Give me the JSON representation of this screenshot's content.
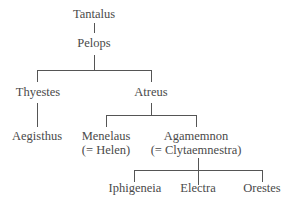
{
  "diagram": {
    "type": "family-tree",
    "nodes": {
      "tantalus": {
        "name": "Tantalus"
      },
      "pelops": {
        "name": "Pelops"
      },
      "thyestes": {
        "name": "Thyestes"
      },
      "atreus": {
        "name": "Atreus"
      },
      "aegisthus": {
        "name": "Aegisthus"
      },
      "menelaus": {
        "name": "Menelaus",
        "spouse": "(= Helen)"
      },
      "agamemnon": {
        "name": "Agamemnon",
        "spouse": "(= Clytaemnestra)"
      },
      "iphigeneia": {
        "name": "Iphigeneia"
      },
      "electra": {
        "name": "Electra"
      },
      "orestes": {
        "name": "Orestes"
      }
    },
    "edges": [
      [
        "Tantalus",
        "Pelops"
      ],
      [
        "Pelops",
        "Thyestes"
      ],
      [
        "Pelops",
        "Atreus"
      ],
      [
        "Thyestes",
        "Aegisthus"
      ],
      [
        "Atreus",
        "Menelaus"
      ],
      [
        "Atreus",
        "Agamemnon"
      ],
      [
        "Agamemnon",
        "Iphigeneia"
      ],
      [
        "Agamemnon",
        "Electra"
      ],
      [
        "Agamemnon",
        "Orestes"
      ]
    ]
  }
}
